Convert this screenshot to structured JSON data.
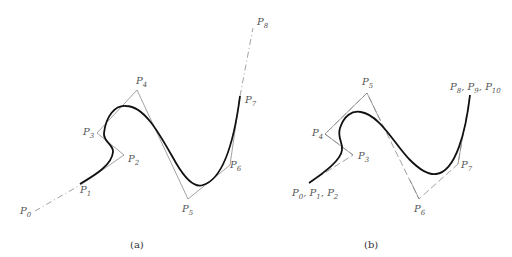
{
  "colors": {
    "curve": "#111111",
    "polygon": "#8a8a8a",
    "label": "#555555",
    "background": "#ffffff"
  },
  "panels": [
    {
      "caption": "(a)",
      "labels": [
        {
          "id": "p0",
          "base": "P",
          "sub": "0",
          "x": 20,
          "y": 206
        },
        {
          "id": "p1",
          "base": "P",
          "sub": "1",
          "x": 80,
          "y": 185
        },
        {
          "id": "p2",
          "base": "P",
          "sub": "2",
          "x": 128,
          "y": 154
        },
        {
          "id": "p3",
          "base": "P",
          "sub": "3",
          "x": 83,
          "y": 127
        },
        {
          "id": "p4",
          "base": "P",
          "sub": "4",
          "x": 136,
          "y": 76
        },
        {
          "id": "p5",
          "base": "P",
          "sub": "5",
          "x": 182,
          "y": 204
        },
        {
          "id": "p6",
          "base": "P",
          "sub": "6",
          "x": 230,
          "y": 160
        },
        {
          "id": "p7",
          "base": "P",
          "sub": "7",
          "x": 245,
          "y": 95
        },
        {
          "id": "p8",
          "base": "P",
          "sub": "8",
          "x": 257,
          "y": 17
        }
      ]
    },
    {
      "caption": "(b)",
      "labels": [
        {
          "id": "p012",
          "text": "P0, P1, P2",
          "parts": [
            [
              "P",
              "0"
            ],
            [
              "P",
              "1"
            ],
            [
              "P",
              "2"
            ]
          ],
          "x": 292,
          "y": 188
        },
        {
          "id": "p3",
          "base": "P",
          "sub": "3",
          "x": 358,
          "y": 151
        },
        {
          "id": "p4",
          "base": "P",
          "sub": "4",
          "x": 312,
          "y": 128
        },
        {
          "id": "p5",
          "base": "P",
          "sub": "5",
          "x": 362,
          "y": 77
        },
        {
          "id": "p6",
          "base": "P",
          "sub": "6",
          "x": 414,
          "y": 204
        },
        {
          "id": "p7",
          "base": "P",
          "sub": "7",
          "x": 461,
          "y": 160
        },
        {
          "id": "p8910",
          "text": "P8, P9, P10",
          "parts": [
            [
              "P",
              "8"
            ],
            [
              "P",
              "9"
            ],
            [
              "P",
              "10"
            ]
          ],
          "x": 450,
          "y": 82
        }
      ]
    }
  ]
}
